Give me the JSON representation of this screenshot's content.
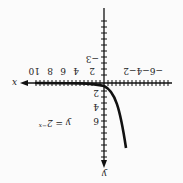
{
  "figure": {
    "equation": "y = 2^-x",
    "equation_display": "y = 2",
    "equation_exp": "−x",
    "x_axis_label": "x",
    "y_axis_label": "y",
    "x_ticks_positive": [
      "2",
      "4",
      "6",
      "8",
      "10"
    ],
    "x_ticks_negative": "−6−4−2",
    "y_ticks": [
      "2",
      "4",
      "6"
    ],
    "y_tick_negative": "−3",
    "orientation": "rotated 180°"
  }
}
